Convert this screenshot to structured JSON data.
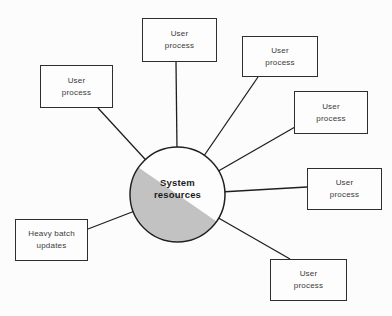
{
  "diagram": {
    "center": {
      "label": [
        "System",
        "resources"
      ]
    },
    "boxes": [
      {
        "name": "user-process-top-left",
        "lines": [
          "User",
          "process"
        ]
      },
      {
        "name": "user-process-top",
        "lines": [
          "User",
          "process"
        ]
      },
      {
        "name": "user-process-upper-right",
        "lines": [
          "User",
          "process"
        ]
      },
      {
        "name": "user-process-right-upper",
        "lines": [
          "User",
          "process"
        ]
      },
      {
        "name": "user-process-right",
        "lines": [
          "User",
          "process"
        ]
      },
      {
        "name": "user-process-bottom-right",
        "lines": [
          "User",
          "process"
        ]
      },
      {
        "name": "heavy-batch-updates",
        "lines": [
          "Heavy batch",
          "updates"
        ]
      }
    ],
    "colors": {
      "background": "#fcfcfc",
      "circle_fill": "#fdfdfd",
      "circle_shade": "#c2c2c2",
      "stroke": "#1f1f1f",
      "box_border": "#2e2e2e",
      "text": "#3a3a3a"
    }
  }
}
